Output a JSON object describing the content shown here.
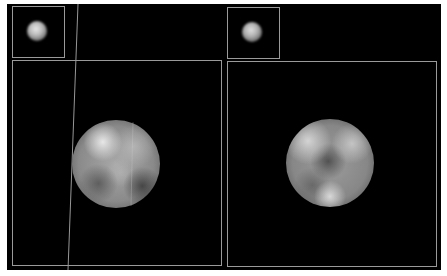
{
  "figure": {
    "background": "#000000",
    "frame_color": "#9a9a9a",
    "panels": [
      {
        "id": "left",
        "inset": {
          "label": ""
        },
        "main": {
          "label": ""
        }
      },
      {
        "id": "right",
        "inset": {
          "label": ""
        },
        "main": {
          "label": ""
        }
      }
    ]
  }
}
